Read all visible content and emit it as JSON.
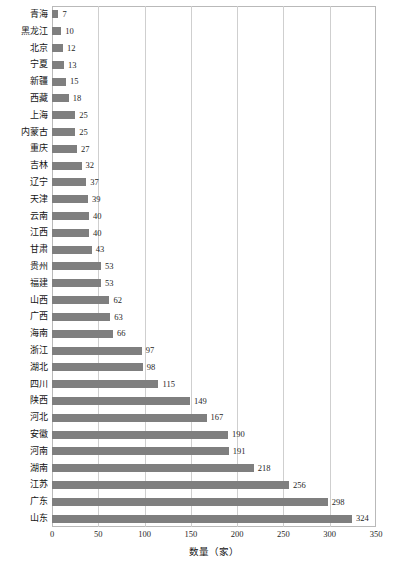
{
  "chart_data": {
    "type": "bar",
    "orientation": "horizontal",
    "title": "",
    "xlabel": "数量（家）",
    "ylabel": "",
    "xlim": [
      0,
      350
    ],
    "ylim": null,
    "grid": "vertical",
    "legend": "none",
    "xticks": [
      0,
      50,
      100,
      150,
      200,
      250,
      300,
      350
    ],
    "bar_color": "#7f7f7f",
    "frame_color": "#b9b9b9",
    "grid_color": "#cfcfcf",
    "categories": [
      "青海",
      "黑龙江",
      "北京",
      "宁夏",
      "新疆",
      "西藏",
      "上海",
      "内蒙古",
      "重庆",
      "吉林",
      "辽宁",
      "天津",
      "云南",
      "江西",
      "甘肃",
      "贵州",
      "福建",
      "山西",
      "广西",
      "海南",
      "浙江",
      "湖北",
      "四川",
      "陕西",
      "河北",
      "安徽",
      "河南",
      "湖南",
      "江苏",
      "广东",
      "山东"
    ],
    "values": [
      7,
      10,
      12,
      13,
      15,
      18,
      25,
      25,
      27,
      32,
      37,
      39,
      40,
      40,
      43,
      53,
      53,
      62,
      63,
      66,
      97,
      98,
      115,
      149,
      167,
      190,
      191,
      218,
      256,
      298,
      324
    ],
    "value_labels": [
      "7",
      "10",
      "12",
      "13",
      "15",
      "18",
      "25",
      "25",
      "27",
      "32",
      "37",
      "39",
      "40",
      "40",
      "43",
      "53",
      "53",
      "62",
      "63",
      "66",
      "97",
      "98",
      "115",
      "149",
      "167",
      "190",
      "191",
      "218",
      "256",
      "298",
      "324"
    ]
  }
}
